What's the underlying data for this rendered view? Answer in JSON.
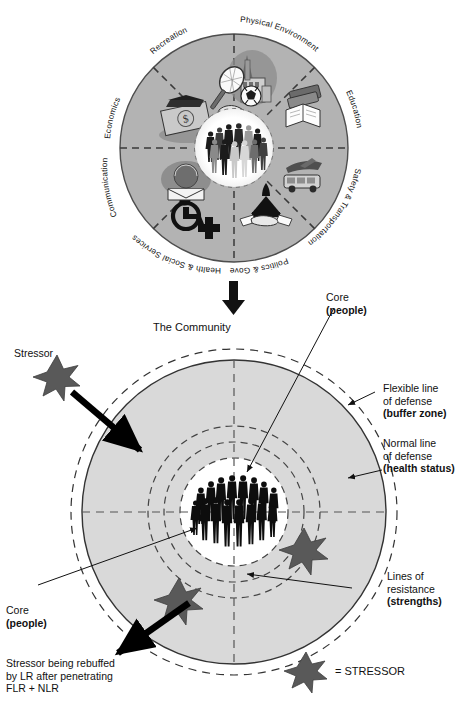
{
  "figure": {
    "colors": {
      "wheel_fill": "#b3b3b3",
      "wheel_stroke": "#4d4d4d",
      "core_fill": "#ffffff",
      "community_fill": "#d9d9d9",
      "star_fill": "#595959",
      "line": "#111111",
      "dash": "#333333",
      "text": "#111111"
    }
  },
  "wheel": {
    "hub_name": "people",
    "sectors": [
      {
        "label": "Physical Environment",
        "icon": "city-skyline-icon"
      },
      {
        "label": "Education",
        "icon": "open-book-icon"
      },
      {
        "label": "Safety & Transportation",
        "icon": "bus-and-plane-icon"
      },
      {
        "label": "Politics & Government",
        "icon": "capitol-handshake-icon"
      },
      {
        "label": "Health & Social Services",
        "icon": "wheelchair-cross-icon"
      },
      {
        "label": "Communication",
        "icon": "telephone-letter-icon"
      },
      {
        "label": "Economics",
        "icon": "dollar-bill-icon"
      },
      {
        "label": "Recreation",
        "icon": "tennis-soccer-icon"
      }
    ]
  },
  "connector": {
    "icon": "down-arrow-icon"
  },
  "community": {
    "title": "The Community",
    "core": {
      "line1": "Core",
      "line2": "(people)"
    },
    "core_bottom": {
      "line1": "Core",
      "line2": "(people)"
    },
    "flexible_line": {
      "line1": "Flexible line",
      "line2": "of defense",
      "line3": "(buffer zone)"
    },
    "normal_line": {
      "line1": "Normal line",
      "line2": "of defense",
      "line3": "(health status)"
    },
    "lines_of_resistance": {
      "line1": "Lines of",
      "line2": "resistance",
      "line3": "(strengths)"
    },
    "stressor_label": "Stressor",
    "rebuffed": {
      "line1": "Stressor being rebuffed",
      "line2": "by LR after penetrating",
      "line3": "FLR + NLR"
    },
    "legend": {
      "label": "= STRESSOR",
      "icon": "star-icon"
    }
  }
}
